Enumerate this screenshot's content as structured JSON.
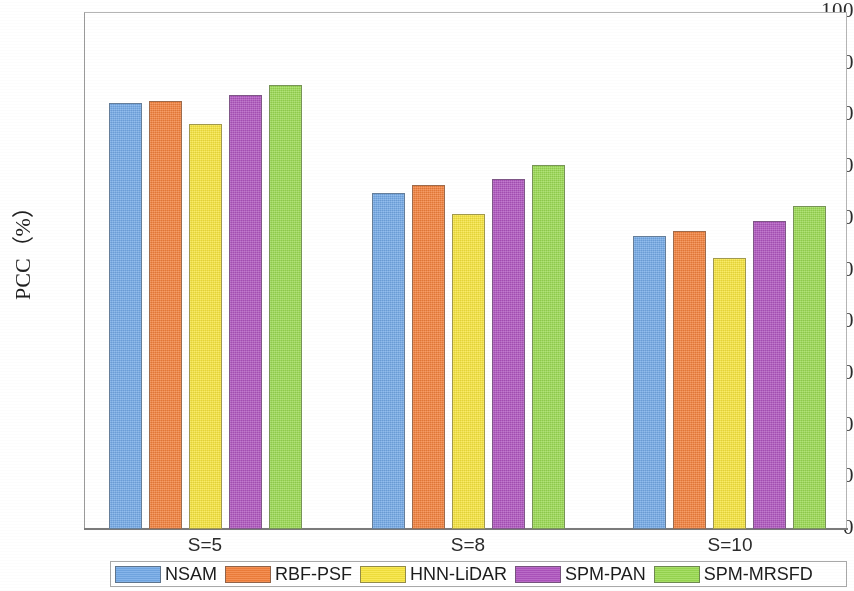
{
  "chart_data": {
    "type": "bar",
    "title": "",
    "xlabel": "",
    "ylabel": "PCC（%）",
    "categories": [
      "S=5",
      "S=8",
      "S=10"
    ],
    "ylim": [
      0,
      100
    ],
    "yticks": [
      0,
      10,
      20,
      30,
      40,
      50,
      60,
      70,
      80,
      90,
      100
    ],
    "ytick_labels": [
      "0",
      "10",
      "20",
      "30",
      "40",
      "50",
      "60",
      "70",
      "80",
      "90",
      "100"
    ],
    "grid": false,
    "legend_position": "bottom-outside",
    "series": [
      {
        "name": "NSAM",
        "color": "#74aae8",
        "values": [
          82.4,
          65.0,
          56.7
        ]
      },
      {
        "name": "RBF-PSF",
        "color": "#f4813c",
        "values": [
          82.8,
          66.5,
          57.6
        ]
      },
      {
        "name": "HNN-LiDAR",
        "color": "#f8e63d",
        "values": [
          78.4,
          61.0,
          52.5
        ]
      },
      {
        "name": "SPM-PAN",
        "color": "#b055c0",
        "values": [
          83.9,
          67.7,
          59.5
        ]
      },
      {
        "name": "SPM-MRSFD",
        "color": "#9bdb52",
        "values": [
          85.8,
          70.4,
          62.5
        ]
      }
    ]
  },
  "axis": {
    "y_title": "PCC（%）"
  },
  "legend": {
    "items": [
      {
        "label": "NSAM"
      },
      {
        "label": "RBF-PSF"
      },
      {
        "label": "HNN-LiDAR"
      },
      {
        "label": "SPM-PAN"
      },
      {
        "label": "SPM-MRSFD"
      }
    ]
  }
}
